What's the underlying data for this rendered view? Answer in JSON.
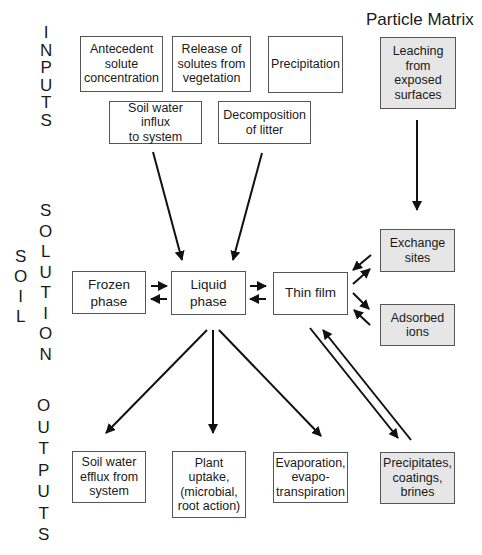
{
  "header": {
    "particle_matrix": "Particle Matrix"
  },
  "side_labels": {
    "inputs": [
      "I",
      "N",
      "P",
      "U",
      "T",
      "S"
    ],
    "soil": [
      "S",
      "O",
      "I",
      "L"
    ],
    "solution": [
      "S",
      "O",
      "L",
      "U",
      "T",
      "I",
      "O",
      "N"
    ],
    "outputs": [
      "O",
      "U",
      "T",
      "P",
      "U",
      "T",
      "S"
    ]
  },
  "inputs": {
    "antecedent": "Antecedent\nsolute\nconcentration",
    "release": "Release of\nsolutes from\nvegetation",
    "precipitation": "Precipitation",
    "influx": "Soil water influx\nto system",
    "decomposition": "Decomposition\nof litter"
  },
  "particle_matrix": {
    "leaching": "Leaching\nfrom\nexposed\nsurfaces",
    "exchange": "Exchange\nsites",
    "adsorbed": "Adsorbed\nions"
  },
  "solution": {
    "frozen": "Frozen\nphase",
    "liquid": "Liquid\nphase",
    "thin_film": "Thin film"
  },
  "outputs": {
    "efflux": "Soil water\nefflux from\nsystem",
    "plant": "Plant\nuptake,\n(microbial,\nroot action)",
    "evaporation": "Evaporation,\nevapo-\ntranspiration",
    "precipitates": "Precipitates,\ncoatings,\nbrines"
  },
  "colors": {
    "box_border": "#555555",
    "grey_fill": "#e6e6e6",
    "arrow": "#111111"
  }
}
